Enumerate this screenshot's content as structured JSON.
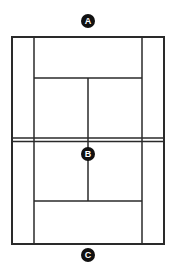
{
  "diagram": {
    "title": "",
    "type": "tennis-court",
    "colors": {
      "line": "#2a2a2a",
      "marker_fill": "#111111",
      "marker_text": "#ffffff",
      "background": "#ffffff"
    },
    "markers": [
      {
        "id": "A",
        "label": "A",
        "position": "behind-top-baseline"
      },
      {
        "id": "B",
        "label": "B",
        "position": "net-center"
      },
      {
        "id": "C",
        "label": "C",
        "position": "behind-bottom-baseline"
      }
    ]
  }
}
